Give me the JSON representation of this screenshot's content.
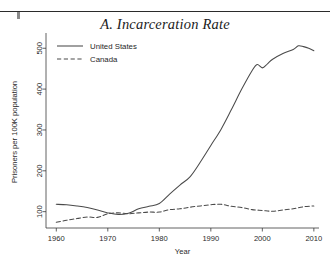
{
  "figure": {
    "title": "A. Incarceration Rate",
    "page_rule": "horizontal-rule"
  },
  "chart_data": {
    "type": "line",
    "title": "A. Incarceration Rate",
    "xlabel": "Year",
    "ylabel": "Prisoners per 100K population",
    "xlim": [
      1958,
      2011
    ],
    "ylim": [
      60,
      530
    ],
    "grid": false,
    "legend_position": "top-left",
    "xticks": [
      1960,
      1970,
      1980,
      1990,
      2000,
      2010
    ],
    "xtick_labels": [
      "1960",
      "1970",
      "1980",
      "1990",
      "2000",
      "2010"
    ],
    "yticks": [
      100,
      200,
      300,
      400,
      500
    ],
    "ytick_labels": [
      "100",
      "200",
      "300",
      "400",
      "500"
    ],
    "series": [
      {
        "name": "United States",
        "style": "solid",
        "color": "#4a4a4a",
        "x": [
          1960,
          1962,
          1964,
          1966,
          1968,
          1970,
          1972,
          1974,
          1976,
          1978,
          1980,
          1982,
          1984,
          1986,
          1988,
          1990,
          1992,
          1994,
          1996,
          1998,
          1999,
          2000,
          2001,
          2002,
          2004,
          2006,
          2007,
          2008,
          2009,
          2010
        ],
        "values": [
          118,
          117,
          114,
          110,
          104,
          97,
          93,
          96,
          107,
          113,
          120,
          143,
          165,
          186,
          222,
          262,
          302,
          350,
          400,
          445,
          460,
          452,
          462,
          473,
          487,
          497,
          506,
          504,
          500,
          494
        ]
      },
      {
        "name": "Canada",
        "style": "dashed",
        "color": "#4a4a4a",
        "x": [
          1960,
          1962,
          1964,
          1966,
          1968,
          1970,
          1972,
          1974,
          1976,
          1978,
          1980,
          1982,
          1984,
          1986,
          1988,
          1990,
          1992,
          1994,
          1996,
          1998,
          2000,
          2002,
          2004,
          2006,
          2008,
          2010
        ],
        "values": [
          74,
          79,
          83,
          87,
          86,
          95,
          97,
          95,
          97,
          99,
          99,
          105,
          107,
          111,
          114,
          117,
          118,
          113,
          110,
          105,
          103,
          101,
          104,
          107,
          112,
          114
        ]
      }
    ]
  },
  "legend": {
    "entries": [
      {
        "label": "United States",
        "style": "solid"
      },
      {
        "label": "Canada",
        "style": "dashed"
      }
    ]
  }
}
